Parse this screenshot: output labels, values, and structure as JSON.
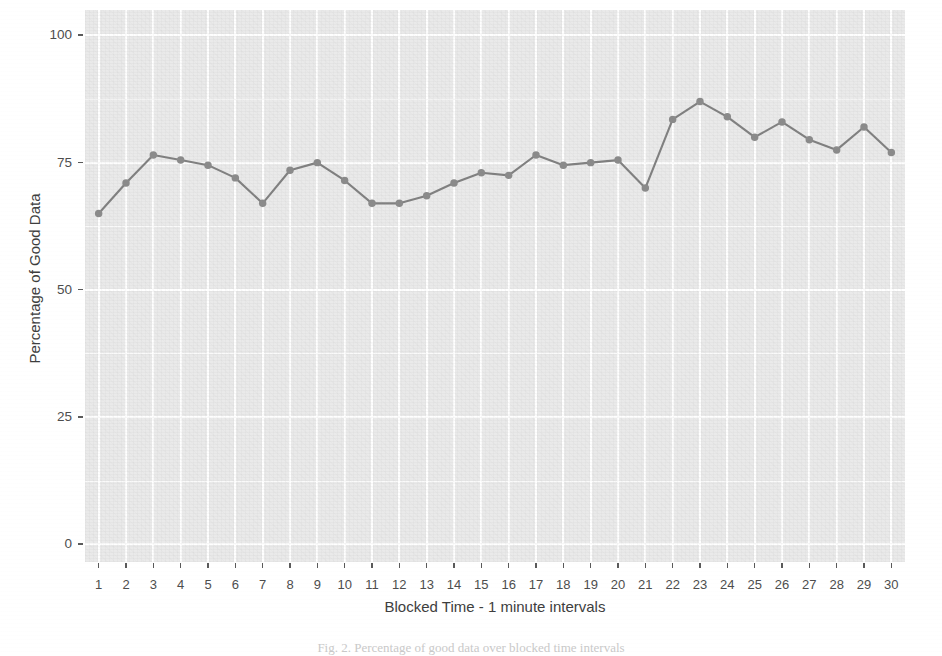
{
  "chart_data": {
    "type": "line",
    "title": "",
    "xlabel": "Blocked Time - 1 minute intervals",
    "ylabel": "Percentage of Good Data",
    "x": [
      1,
      2,
      3,
      4,
      5,
      6,
      7,
      8,
      9,
      10,
      11,
      12,
      13,
      14,
      15,
      16,
      17,
      18,
      19,
      20,
      21,
      22,
      23,
      24,
      25,
      26,
      27,
      28,
      29,
      30
    ],
    "values": [
      65,
      71,
      76.5,
      75.5,
      74.5,
      72,
      67,
      73.5,
      75,
      71.5,
      67,
      67,
      68.5,
      71,
      73,
      72.5,
      76.5,
      74.5,
      75,
      75.5,
      70,
      83.5,
      87,
      84,
      80,
      83,
      79.5,
      77.5,
      82,
      77
    ],
    "series": [
      {
        "name": "Percentage of Good Data",
        "values": [
          65,
          71,
          76.5,
          75.5,
          74.5,
          72,
          67,
          73.5,
          75,
          71.5,
          67,
          67,
          68.5,
          71,
          73,
          72.5,
          76.5,
          74.5,
          75,
          75.5,
          70,
          83.5,
          87,
          84,
          80,
          83,
          79.5,
          77.5,
          82,
          77
        ]
      }
    ],
    "xtick_labels": [
      "1",
      "2",
      "3",
      "4",
      "5",
      "6",
      "7",
      "8",
      "9",
      "10",
      "11",
      "12",
      "13",
      "14",
      "15",
      "16",
      "17",
      "18",
      "19",
      "20",
      "21",
      "22",
      "23",
      "24",
      "25",
      "26",
      "27",
      "28",
      "29",
      "30"
    ],
    "ytick_labels": [
      "0",
      "25",
      "50",
      "75",
      "100"
    ],
    "ytick_values": [
      0,
      25,
      50,
      75,
      100
    ],
    "ylim": [
      -3.5,
      105
    ],
    "xlim": [
      0.5,
      30.5
    ],
    "grid": true,
    "grid_color": "#ffffff",
    "panel_background": "#eaeaea",
    "line_color": "#7f7f7f",
    "point_color": "#8a8a8a",
    "legend": "none",
    "marker": "circle",
    "marker_size": 6
  },
  "caption": {
    "text": "Fig. 2.  Percentage of good data over blocked time intervals"
  },
  "axes": {
    "y_title": "Percentage of Good Data",
    "x_title": "Blocked Time - 1 minute intervals"
  }
}
